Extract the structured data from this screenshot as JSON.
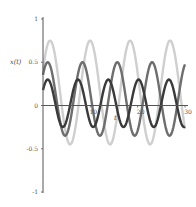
{
  "chart_data": {
    "type": "line",
    "title": "",
    "xlabel": "t",
    "ylabel": "x(t)",
    "xlim": [
      0,
      30
    ],
    "ylim": [
      -1,
      1
    ],
    "grid": false,
    "legend": "none",
    "x_ticks": [
      {
        "value": 10,
        "label": "10"
      },
      {
        "value": 20,
        "label": "20"
      },
      {
        "value": 30,
        "label": "30"
      }
    ],
    "y_ticks": [
      {
        "value": 1,
        "label": "1"
      },
      {
        "value": 0.5,
        "label": "0.5"
      },
      {
        "value": 0,
        "label": "0"
      },
      {
        "value": -0.5,
        "label": "-0.5"
      },
      {
        "value": -1,
        "label": "-1"
      }
    ],
    "series": [
      {
        "name": "light",
        "color": "#cfcfcf",
        "function": "0.15 + 0.6*sin(2*pi*(t-1.5)/8.45 + pi/2)",
        "offset": 0.15,
        "amplitude": 0.6,
        "period": 8.45,
        "first_peak_t": 1.5
      },
      {
        "name": "medium",
        "color": "#6e6e6e",
        "function": "0.075 + 0.425*sin(2*pi*(t-1.0)/7.35 + pi/2)",
        "offset": 0.075,
        "amplitude": 0.425,
        "period": 7.35,
        "first_peak_t": 1.0
      },
      {
        "name": "dark",
        "color": "#3a3a3a",
        "function": "0.025 + 0.275*sin(2*pi*(t-1.0)/6.4 + pi/2)",
        "offset": 0.025,
        "amplitude": 0.275,
        "period": 6.4,
        "first_peak_t": 1.0
      }
    ]
  }
}
